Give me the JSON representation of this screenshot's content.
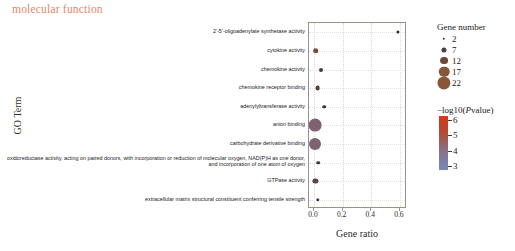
{
  "title": "molecular function",
  "axes": {
    "y_title": "GO Term",
    "x_title": "Gene ratio"
  },
  "size_legend": {
    "title": "Gene number",
    "values": [
      "2",
      "7",
      "12",
      "17",
      "22"
    ]
  },
  "color_legend": {
    "title": "−log10(Pvalue)",
    "ticks": [
      "6",
      "5",
      "4",
      "3"
    ]
  },
  "chart_data": {
    "type": "scatter",
    "title": "molecular function",
    "xlabel": "Gene ratio",
    "ylabel": "GO Term",
    "xlim": [
      -0.035,
      0.65
    ],
    "xticks": [
      0.0,
      0.2,
      0.4,
      0.6
    ],
    "xticklabels": [
      "0.0",
      "0.2",
      "0.4",
      "0.6"
    ],
    "grid": true,
    "legend_position": "right",
    "size_legend_title": "Gene number",
    "size_legend_values": [
      2,
      7,
      12,
      17,
      22
    ],
    "color_legend_title": "−log10(Pvalue)",
    "color_legend_ticks": [
      6,
      5,
      4,
      3
    ],
    "color_scale_low": "#7b88b0",
    "color_scale_mid": "#8a6f86",
    "color_scale_high": "#d63a1e",
    "categories": [
      "2'-5'-oligoadenylate synthetase activity",
      "cytokine activity",
      "chemokine activity",
      "chemokine receptor binding",
      "adenylyltransferase activity",
      "anion binding",
      "carbohydrate derivative binding",
      "oxidoreductase activity, acting on paired donors, with incorporation or reduction of molecular oxygen, NAD(P)H as one donor, and incorporation of one atom of oxygen",
      "GTPase activity",
      "extracellular matrix structural constituent conferring tensile strength"
    ],
    "points": [
      {
        "category": "2'-5'-oligoadenylate synthetase activity",
        "gene_ratio": 0.585,
        "gene_number": 2,
        "neg_log10_p": 6.0,
        "color": "#2b2b2b",
        "radius": 1.6
      },
      {
        "category": "cytokine activity",
        "gene_ratio": 0.012,
        "gene_number": 5,
        "neg_log10_p": 5.4,
        "color": "#7a4a3a",
        "radius": 2.8
      },
      {
        "category": "chemokine activity",
        "gene_ratio": 0.047,
        "gene_number": 3,
        "neg_log10_p": 5.0,
        "color": "#4a3a3a",
        "radius": 2.0
      },
      {
        "category": "chemokine receptor binding",
        "gene_ratio": 0.025,
        "gene_number": 4,
        "neg_log10_p": 4.7,
        "color": "#53403e",
        "radius": 2.4
      },
      {
        "category": "adenylyltransferase activity",
        "gene_ratio": 0.07,
        "gene_number": 2,
        "neg_log10_p": 4.4,
        "color": "#3a3a3a",
        "radius": 1.8
      },
      {
        "category": "anion binding",
        "gene_ratio": 0.008,
        "gene_number": 22,
        "neg_log10_p": 3.6,
        "color": "#7e6272",
        "radius": 6.4
      },
      {
        "category": "carbohydrate derivative binding",
        "gene_ratio": 0.008,
        "gene_number": 20,
        "neg_log10_p": 3.4,
        "color": "#7e6272",
        "radius": 6.0
      },
      {
        "category": "oxidoreductase activity, acting on paired donors, with incorporation or reduction of molecular oxygen, NAD(P)H as one donor, and incorporation of one atom of oxygen",
        "gene_ratio": 0.03,
        "gene_number": 2,
        "neg_log10_p": 3.3,
        "color": "#3a3a3a",
        "radius": 1.8
      },
      {
        "category": "GTPase activity",
        "gene_ratio": 0.01,
        "gene_number": 5,
        "neg_log10_p": 3.2,
        "color": "#5a4450",
        "radius": 2.6
      },
      {
        "category": "extracellular matrix structural constituent conferring tensile strength",
        "gene_ratio": 0.028,
        "gene_number": 2,
        "neg_log10_p": 3.0,
        "color": "#3a3a3a",
        "radius": 1.7
      }
    ]
  }
}
